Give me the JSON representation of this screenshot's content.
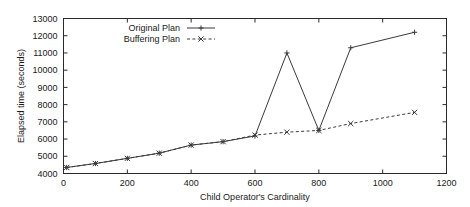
{
  "chart_data": {
    "type": "line",
    "title": "",
    "xlabel": "Child Operator's Cardinality",
    "ylabel": "Elapsed time (seconds)",
    "xlim": [
      0,
      1200
    ],
    "ylim": [
      4000,
      13000
    ],
    "xticks": [
      0,
      200,
      400,
      600,
      800,
      1000,
      1200
    ],
    "yticks": [
      4000,
      5000,
      6000,
      7000,
      8000,
      9000,
      10000,
      11000,
      12000,
      13000
    ],
    "grid": false,
    "legend_position": "top-left-inside",
    "series": [
      {
        "name": "Original Plan",
        "style": "solid",
        "marker": "plus",
        "x": [
          10,
          100,
          200,
          300,
          400,
          500,
          600,
          700,
          800,
          900,
          1100
        ],
        "values": [
          4350,
          4580,
          4880,
          5180,
          5650,
          5850,
          6180,
          11000,
          6500,
          11300,
          12200
        ]
      },
      {
        "name": "Buffering Plan",
        "style": "dashed",
        "marker": "cross",
        "x": [
          10,
          100,
          200,
          300,
          400,
          500,
          600,
          700,
          800,
          900,
          1100
        ],
        "values": [
          4350,
          4580,
          4880,
          5180,
          5650,
          5850,
          6230,
          6400,
          6500,
          6900,
          7550
        ]
      }
    ]
  },
  "legend": {
    "entries": [
      {
        "label": "Original Plan"
      },
      {
        "label": "Buffering Plan"
      }
    ]
  },
  "axes": {
    "x_label": "Child Operator's Cardinality",
    "y_label": "Elapsed time (seconds)",
    "x_tick_labels": [
      "0",
      "200",
      "400",
      "600",
      "800",
      "1000",
      "1200"
    ],
    "y_tick_labels": [
      "4000",
      "5000",
      "6000",
      "7000",
      "8000",
      "9000",
      "10000",
      "11000",
      "12000",
      "13000"
    ]
  },
  "colors": {
    "line": "#3a3a3a",
    "frame": "#2a2a2a",
    "text": "#1a1a1a",
    "background": "#ffffff"
  }
}
